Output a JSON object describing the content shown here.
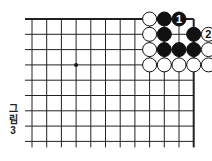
{
  "diagram": {
    "type": "go-board-fragment",
    "caption_lines": [
      "그",
      "림",
      "3"
    ],
    "grid": {
      "columns": 12,
      "rows": 9,
      "origin_x": 32,
      "origin_y": 19,
      "spacing_x": 14.7,
      "spacing_y": 15.3,
      "line_extend_left": 7,
      "line_extend_bottom": 6,
      "edges": [
        "top",
        "right"
      ],
      "line_color": "#222222"
    },
    "star_points": [
      {
        "col": 3,
        "row": 3
      }
    ],
    "stones": [
      {
        "col": 8,
        "row": 0,
        "color": "white"
      },
      {
        "col": 9,
        "row": 0,
        "color": "black"
      },
      {
        "col": 10,
        "row": 0,
        "color": "black",
        "label": "1"
      },
      {
        "col": 8,
        "row": 1,
        "color": "white"
      },
      {
        "col": 9,
        "row": 1,
        "color": "black"
      },
      {
        "col": 11,
        "row": 1,
        "color": "black"
      },
      {
        "col": 12,
        "row": 1,
        "color": "white",
        "label": "2"
      },
      {
        "col": 8,
        "row": 2,
        "color": "white"
      },
      {
        "col": 9,
        "row": 2,
        "color": "black"
      },
      {
        "col": 10,
        "row": 2,
        "color": "black"
      },
      {
        "col": 11,
        "row": 2,
        "color": "black"
      },
      {
        "col": 12,
        "row": 2,
        "color": "white"
      },
      {
        "col": 8,
        "row": 3,
        "color": "white"
      },
      {
        "col": 9,
        "row": 3,
        "color": "white"
      },
      {
        "col": 10,
        "row": 3,
        "color": "white"
      },
      {
        "col": 11,
        "row": 3,
        "color": "white"
      },
      {
        "col": 12,
        "row": 3,
        "color": "white"
      }
    ]
  }
}
